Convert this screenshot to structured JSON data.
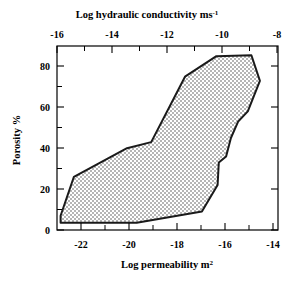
{
  "chart_data": {
    "type": "area",
    "title": "",
    "xlabel": "Log permeability m2",
    "xlabel_base": "Log permeability m",
    "xlabel_sup": "2",
    "ylabel": "Porosity %",
    "top_xlabel_base": "Log hydraulic conductivity ms",
    "top_xlabel_sup": "-1",
    "xlim": [
      -23.0,
      -13.85
    ],
    "ylim": [
      0,
      90
    ],
    "top_xlim": [
      -16.2,
      -7.05
    ],
    "xticks": [
      -22,
      -20,
      -18,
      -16,
      -14
    ],
    "xtick_labels": [
      "-22",
      "-20",
      "-18",
      "-16",
      "-14"
    ],
    "xticks_minor": [
      -23,
      -21,
      -19,
      -17,
      -15
    ],
    "yticks": [
      0,
      20,
      40,
      60,
      80
    ],
    "ytick_labels": [
      "0",
      "20",
      "40",
      "60",
      "80"
    ],
    "yticks_minor": [
      10,
      30,
      50,
      70
    ],
    "top_xticks": [
      -16,
      -14,
      -12,
      -10,
      -8
    ],
    "top_xtick_labels": [
      "-16",
      "-14",
      "-12",
      "-10",
      "-8"
    ],
    "top_xticks_minor": [
      -15,
      -13,
      -11,
      -9,
      -7
    ],
    "grid": false,
    "legend": "none",
    "series": [
      {
        "name": "permeability-porosity envelope",
        "fill": "#d9d9d9",
        "stroke": "#1a1a1a",
        "points": [
          [
            -22.85,
            7.0
          ],
          [
            -22.3,
            26.0
          ],
          [
            -20.1,
            40.0
          ],
          [
            -19.1,
            43.0
          ],
          [
            -17.7,
            75.0
          ],
          [
            -16.4,
            85.0
          ],
          [
            -14.95,
            85.5
          ],
          [
            -14.6,
            73.0
          ],
          [
            -15.1,
            58.0
          ],
          [
            -15.5,
            53.0
          ],
          [
            -15.8,
            45.0
          ],
          [
            -16.0,
            36.0
          ],
          [
            -16.3,
            33.0
          ],
          [
            -16.35,
            22.0
          ],
          [
            -17.0,
            9.0
          ],
          [
            -19.7,
            3.5
          ],
          [
            -22.85,
            3.5
          ]
        ]
      }
    ]
  }
}
